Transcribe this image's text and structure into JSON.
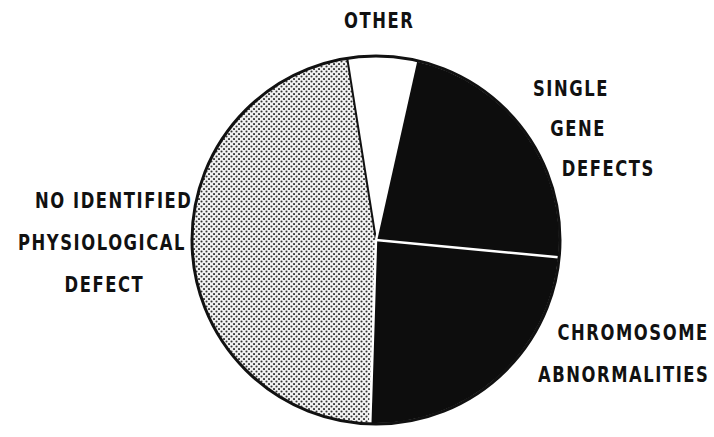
{
  "chart_data": {
    "type": "pie",
    "title": "",
    "slices": [
      {
        "label": "OTHER",
        "value": 6,
        "fill": "white"
      },
      {
        "label": "SINGLE GENE DEFECTS",
        "value": 23,
        "fill": "black"
      },
      {
        "label": "CHROMOSOME ABNORMALITIES",
        "value": 24,
        "fill": "black"
      },
      {
        "label": "NO IDENTIFIED PHYSIOLOGICAL DEFECT",
        "value": 47,
        "fill": "stipple"
      }
    ],
    "start_angle_deg": -9,
    "direction": "clockwise",
    "legend": "none (direct labels)"
  },
  "labels": {
    "other": [
      "OTHER"
    ],
    "single_gene": [
      "SINGLE",
      "GENE",
      "DEFECTS"
    ],
    "chromosome": [
      "CHROMOSOME",
      "ABNORMALITIES"
    ],
    "no_identified": [
      "NO IDENTIFIED",
      "PHYSIOLOGICAL",
      "DEFECT"
    ]
  },
  "colors": {
    "dark": "#0d0d0d",
    "light": "#ffffff",
    "stipple_bg": "#ececec",
    "stipple_dot": "#3a3a3a"
  }
}
